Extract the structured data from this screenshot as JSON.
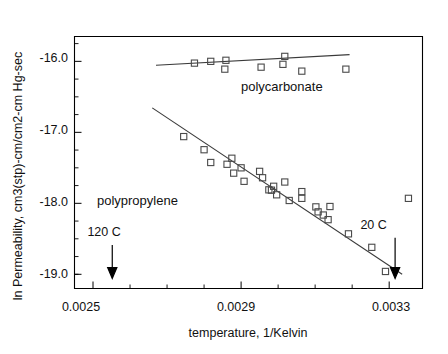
{
  "chart_data": {
    "type": "scatter",
    "title": "",
    "xlabel": "temperature, 1/Kelvin",
    "ylabel": "ln Permeability, cm3(stp)-cm/cm2-cm Hg-sec",
    "xlim": [
      0.00245,
      0.00339
    ],
    "ylim": [
      -19.2,
      -15.65
    ],
    "xticks": [
      0.0025,
      0.0029,
      0.0033
    ],
    "xtick_labels": [
      "0.0025",
      "0.0029",
      "0.0033"
    ],
    "xticks_minor": [
      0.0026,
      0.0027,
      0.0028,
      0.003,
      0.0031,
      0.0032
    ],
    "yticks": [
      -16.0,
      -17.0,
      -18.0,
      -19.0
    ],
    "ytick_labels": [
      "-16.0",
      "-17.0",
      "-18.0",
      "-19.0"
    ],
    "yticks_minor": [
      -15.75,
      -16.25,
      -16.5,
      -16.75,
      -17.25,
      -17.5,
      -17.75,
      -18.25,
      -18.5,
      -18.75,
      -19.0
    ],
    "grid": false,
    "legend": "inline-annotations",
    "marker": "open-square",
    "series": [
      {
        "name": "polycarbonate",
        "label_x": 0.00301,
        "label_y": -16.42,
        "points": [
          [
            0.002774,
            -16.025
          ],
          [
            0.002818,
            -16.0
          ],
          [
            0.002859,
            -15.985
          ],
          [
            0.002856,
            -16.11
          ],
          [
            0.002954,
            -16.082
          ],
          [
            0.003013,
            -16.042
          ],
          [
            0.003018,
            -15.93
          ],
          [
            0.003064,
            -16.138
          ],
          [
            0.003183,
            -16.11
          ]
        ],
        "fit_line": [
          [
            0.00267,
            -16.055
          ],
          [
            0.003193,
            -15.905
          ]
        ]
      },
      {
        "name": "polypropylene",
        "label_x": 0.00262,
        "label_y": -18.03,
        "points": [
          [
            0.002745,
            -17.06
          ],
          [
            0.0028,
            -17.245
          ],
          [
            0.002818,
            -17.425
          ],
          [
            0.002862,
            -17.45
          ],
          [
            0.002875,
            -17.365
          ],
          [
            0.00288,
            -17.575
          ],
          [
            0.0029,
            -17.5
          ],
          [
            0.002908,
            -17.69
          ],
          [
            0.00295,
            -17.55
          ],
          [
            0.002958,
            -17.64
          ],
          [
            0.002975,
            -17.81
          ],
          [
            0.002982,
            -17.815
          ],
          [
            0.002988,
            -17.76
          ],
          [
            0.002996,
            -17.88
          ],
          [
            0.003018,
            -17.7
          ],
          [
            0.00303,
            -17.96
          ],
          [
            0.003064,
            -17.835
          ],
          [
            0.003064,
            -17.93
          ],
          [
            0.003102,
            -18.05
          ],
          [
            0.003108,
            -18.12
          ],
          [
            0.003122,
            -18.165
          ],
          [
            0.003135,
            -18.23
          ],
          [
            0.00314,
            -18.045
          ],
          [
            0.00319,
            -18.43
          ],
          [
            0.003253,
            -18.62
          ],
          [
            0.00329,
            -18.96
          ],
          [
            0.003352,
            -17.93
          ]
        ],
        "fit_line": [
          [
            0.00266,
            -16.655
          ],
          [
            0.003335,
            -19.0
          ]
        ]
      }
    ],
    "annotations": [
      {
        "text": "120 C",
        "x": 0.00253,
        "y": -18.46,
        "arrow_to": -19.06,
        "arrow_x": 0.002552
      },
      {
        "text": "20 C",
        "x": 0.003258,
        "y": -18.36,
        "arrow_to": -19.06,
        "arrow_x": 0.003316
      }
    ]
  },
  "labels": {
    "ytick_0": "-16.0",
    "ytick_1": "-17.0",
    "ytick_2": "-18.0",
    "ytick_3": "-19.0",
    "xtick_0": "0.0025",
    "xtick_1": "0.0029",
    "xtick_2": "0.0033",
    "xaxis_title": "temperature, 1/Kelvin",
    "yaxis_title": "ln Permeability, cm3(stp)-cm/cm2-cm Hg-sec",
    "series_polycarbonate": "polycarbonate",
    "series_polypropylene": "polypropylene",
    "anno_120c": "120 C",
    "anno_20c": "20 C"
  }
}
